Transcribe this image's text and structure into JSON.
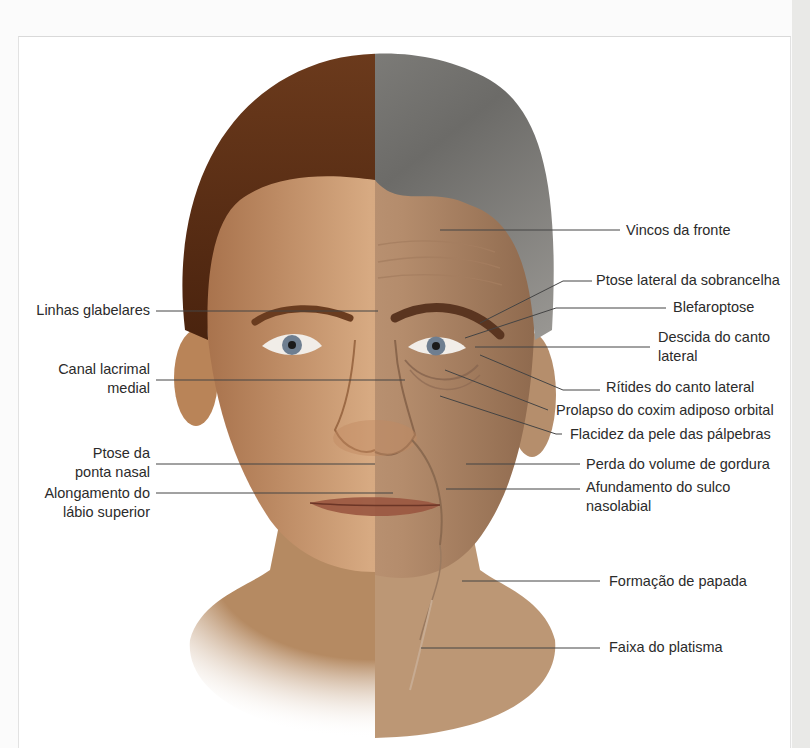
{
  "figure": {
    "colors": {
      "young_hair": "#5a2e14",
      "old_hair": "#7a7a78",
      "skin_young": "#c9956a",
      "skin_old": "#b98c68",
      "leader_line": "#444444",
      "label_text": "#2b2b2b"
    },
    "labels_left": [
      {
        "id": "linhas-glabelares",
        "lines": [
          "Linhas glabelares"
        ],
        "top": 301,
        "right": 150,
        "line": {
          "x1": 156,
          "y1": 311,
          "x2": 378,
          "y2": 311
        }
      },
      {
        "id": "canal-lacrimal-medial",
        "lines": [
          "Canal lacrimal",
          "medial"
        ],
        "top": 360,
        "right": 150,
        "line": {
          "x1": 156,
          "y1": 380,
          "x2": 405,
          "y2": 380
        }
      },
      {
        "id": "ptose-ponta-nasal",
        "lines": [
          "Ptose da",
          "ponta nasal"
        ],
        "top": 444,
        "right": 150,
        "line": {
          "x1": 156,
          "y1": 464,
          "x2": 375,
          "y2": 464
        }
      },
      {
        "id": "alongamento-labio-superior",
        "lines": [
          "Alongamento do",
          "lábio superior"
        ],
        "top": 484,
        "right": 150,
        "line": {
          "x1": 156,
          "y1": 493,
          "x2": 393,
          "y2": 493
        }
      }
    ],
    "labels_right": [
      {
        "id": "vincos-da-fronte",
        "lines": [
          "Vincos da fronte"
        ],
        "top": 221,
        "left": 626,
        "line": {
          "points": "440,230 620,230"
        }
      },
      {
        "id": "ptose-lateral-sobrancelha",
        "lines": [
          "Ptose lateral da sobrancelha"
        ],
        "top": 271,
        "left": 596,
        "line": {
          "points": "480,323 563,281 592,281"
        }
      },
      {
        "id": "blefaroptose",
        "lines": [
          "Blefaroptose"
        ],
        "top": 298,
        "left": 673,
        "line": {
          "points": "465,338 556,308 666,308"
        }
      },
      {
        "id": "descida-canto-lateral",
        "lines": [
          "Descida do canto",
          "lateral"
        ],
        "top": 328,
        "left": 658,
        "line": {
          "points": "475,347 650,347"
        }
      },
      {
        "id": "ritides-canto-lateral",
        "lines": [
          "Rítides do canto lateral"
        ],
        "top": 378,
        "left": 606,
        "line": {
          "points": "480,355 563,390 600,390"
        }
      },
      {
        "id": "prolapso-coxim-adiposo",
        "lines": [
          "Prolapso do coxim adiposo orbital"
        ],
        "top": 401,
        "left": 556,
        "line": {
          "points": "445,370 548,410"
        }
      },
      {
        "id": "flacidez-pele-palpebras",
        "lines": [
          "Flacidez da pele das pálpebras"
        ],
        "top": 425,
        "left": 570,
        "line": {
          "points": "440,396 556,434 562,434"
        }
      },
      {
        "id": "perda-volume-gordura",
        "lines": [
          "Perda do volume de gordura"
        ],
        "top": 455,
        "left": 586,
        "line": {
          "points": "466,464 580,464"
        }
      },
      {
        "id": "afundamento-sulco-nasolabial",
        "lines": [
          "Afundamento do sulco",
          "nasolabial"
        ],
        "top": 478,
        "left": 586,
        "line": {
          "points": "446,489 580,489"
        }
      },
      {
        "id": "formacao-papada",
        "lines": [
          "Formação de papada"
        ],
        "top": 572,
        "left": 609,
        "line": {
          "points": "462,581 600,581"
        }
      },
      {
        "id": "faixa-platisma",
        "lines": [
          "Faixa do platisma"
        ],
        "top": 638,
        "left": 609,
        "line": {
          "points": "421,648 600,648"
        }
      }
    ]
  }
}
